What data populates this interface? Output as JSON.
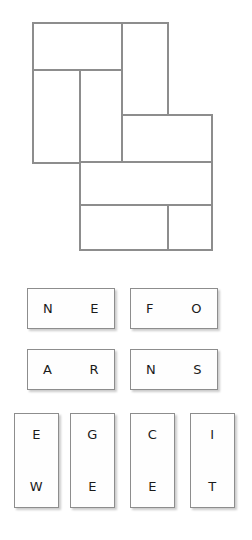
{
  "puzzle": {
    "name": "tile-grid-diagram",
    "stroke_color": "#8d8d8d",
    "fill_color": "#ffffff",
    "outline_label": "",
    "cells": [
      {
        "id": "cell-top-left",
        "x": 33,
        "y": 23,
        "w": 89,
        "h": 47
      },
      {
        "id": "cell-top-right",
        "x": 122,
        "y": 23,
        "w": 46,
        "h": 92
      },
      {
        "id": "cell-left-tall",
        "x": 33,
        "y": 70,
        "w": 47,
        "h": 93
      },
      {
        "id": "cell-mid-left",
        "x": 80,
        "y": 70,
        "w": 42,
        "h": 93
      },
      {
        "id": "cell-mid-right",
        "x": 122,
        "y": 115,
        "w": 90,
        "h": 47
      },
      {
        "id": "cell-bottom-upper",
        "x": 80,
        "y": 162,
        "w": 132,
        "h": 43
      },
      {
        "id": "cell-bottom-lower-left",
        "x": 80,
        "y": 205,
        "w": 88,
        "h": 45
      },
      {
        "id": "cell-bottom-lower-right",
        "x": 168,
        "y": 205,
        "w": 44,
        "h": 45
      }
    ]
  },
  "tray": {
    "tiles": [
      {
        "id": "tile-ne",
        "orientation": "horizontal",
        "letters": [
          "N",
          "E"
        ],
        "x": 27,
        "y": 26
      },
      {
        "id": "tile-fo",
        "orientation": "horizontal",
        "letters": [
          "F",
          "O"
        ],
        "x": 130,
        "y": 26
      },
      {
        "id": "tile-ar",
        "orientation": "horizontal",
        "letters": [
          "A",
          "R"
        ],
        "x": 27,
        "y": 87
      },
      {
        "id": "tile-ns",
        "orientation": "horizontal",
        "letters": [
          "N",
          "S"
        ],
        "x": 130,
        "y": 87
      },
      {
        "id": "tile-ew",
        "orientation": "vertical",
        "letters": [
          "E",
          "W"
        ],
        "x": 14,
        "y": 151
      },
      {
        "id": "tile-ge",
        "orientation": "vertical",
        "letters": [
          "G",
          "E"
        ],
        "x": 70,
        "y": 151
      },
      {
        "id": "tile-ce",
        "orientation": "vertical",
        "letters": [
          "C",
          "E"
        ],
        "x": 130,
        "y": 151
      },
      {
        "id": "tile-it",
        "orientation": "vertical",
        "letters": [
          "I",
          "T"
        ],
        "x": 190,
        "y": 151
      }
    ]
  }
}
